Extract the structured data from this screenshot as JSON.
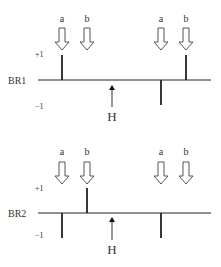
{
  "panels": [
    {
      "name": "BR1",
      "label": "BR1",
      "plus_label": "+1",
      "minus_label": "−1",
      "marker_label": "H",
      "arrows": [
        {
          "label": "a",
          "x": 62
        },
        {
          "label": "b",
          "x": 87
        },
        {
          "label": "a",
          "x": 161
        },
        {
          "label": "b",
          "x": 186
        }
      ],
      "stems": [
        {
          "x": 62,
          "value": 1
        },
        {
          "x": 161,
          "value": -1
        },
        {
          "x": 186,
          "value": 1
        }
      ]
    },
    {
      "name": "BR2",
      "label": "BR2",
      "plus_label": "+1",
      "minus_label": "−1",
      "marker_label": "H",
      "arrows": [
        {
          "label": "a",
          "x": 62
        },
        {
          "label": "b",
          "x": 87
        },
        {
          "label": "a",
          "x": 161
        },
        {
          "label": "b",
          "x": 186
        }
      ],
      "stems": [
        {
          "x": 62,
          "value": -1
        },
        {
          "x": 87,
          "value": 1
        },
        {
          "x": 161,
          "value": -1
        }
      ]
    }
  ],
  "colors": {
    "line": "#222222",
    "arrow_outline": "#555555",
    "text": "#333333"
  }
}
